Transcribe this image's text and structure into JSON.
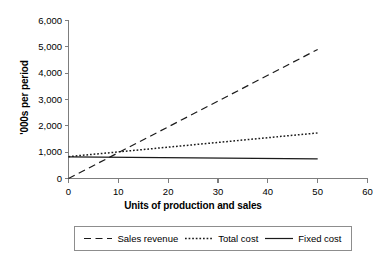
{
  "chart_data": {
    "type": "line",
    "title": "",
    "xlabel": "Units of production and sales",
    "ylabel": "'000s per period",
    "xlim": [
      0,
      60
    ],
    "ylim": [
      0,
      6000
    ],
    "grid": false,
    "legend_position": "bottom",
    "x_ticks": [
      "0",
      "10",
      "20",
      "30",
      "40",
      "50",
      "60"
    ],
    "x_tick_values": [
      0,
      10,
      20,
      30,
      40,
      50,
      60
    ],
    "y_ticks": [
      "0",
      "1,000",
      "2,000",
      "3,000",
      "4,000",
      "5,000",
      "6,000"
    ],
    "y_tick_values": [
      0,
      1000,
      2000,
      3000,
      4000,
      5000,
      6000
    ],
    "series": [
      {
        "name": "Sales revenue",
        "style": "dashed",
        "color": "#1a1a1a",
        "x": [
          0,
          50
        ],
        "values": [
          0,
          4900
        ]
      },
      {
        "name": "Total cost",
        "style": "dotted",
        "color": "#1a1a1a",
        "x": [
          0,
          50
        ],
        "values": [
          830,
          1730
        ]
      },
      {
        "name": "Fixed cost",
        "style": "solid",
        "color": "#1a1a1a",
        "x": [
          0,
          50
        ],
        "values": [
          820,
          745
        ]
      }
    ],
    "legend": [
      {
        "label": "Sales revenue",
        "style": "dashed"
      },
      {
        "label": "Total cost",
        "style": "dotted"
      },
      {
        "label": "Fixed cost",
        "style": "solid"
      }
    ],
    "axis_color": "#7d7d7d",
    "line_color": "#1a1a1a"
  }
}
